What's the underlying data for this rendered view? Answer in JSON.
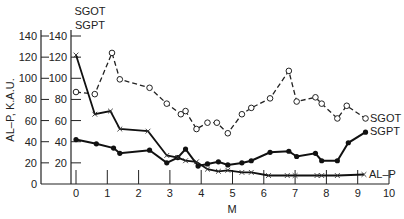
{
  "chart_data": {
    "type": "line",
    "title": "",
    "xlabel": "M",
    "ylabel_left": "AL–P, K.A.U.",
    "ylabel_right_lines": [
      "SGOT",
      "SGPT"
    ],
    "xlim": [
      0,
      10
    ],
    "ylim": [
      0,
      140
    ],
    "x_ticks": [
      0,
      1,
      2,
      3,
      4,
      5,
      6,
      7,
      8,
      9,
      10
    ],
    "x_tick_labels": [
      "0",
      "1",
      "2",
      "3",
      "4",
      "5",
      "6",
      "7",
      "8",
      "9",
      "10"
    ],
    "y_ticks": [
      0,
      20,
      40,
      60,
      80,
      100,
      120,
      140
    ],
    "y_tick_labels_left": [
      "0",
      "20",
      "40",
      "60",
      "80",
      "100",
      "120",
      "140"
    ],
    "y_tick_labels_inner": [
      "20",
      "40",
      "60",
      "80",
      "100",
      "120",
      "140"
    ],
    "grid": false,
    "legend": "inline labels at right end of each series",
    "series": [
      {
        "name": "SGOT",
        "marker": "open-circle",
        "line": "dashed",
        "x": [
          0,
          0.6,
          1.15,
          1.4,
          2.35,
          2.9,
          3.35,
          3.5,
          3.85,
          4.2,
          4.5,
          4.85,
          5.3,
          5.6,
          6.2,
          6.8,
          7.05,
          7.65,
          7.85,
          8.35,
          8.65,
          9.25
        ],
        "y": [
          87,
          85,
          124,
          99,
          91,
          76,
          66,
          69,
          52,
          58,
          58,
          48,
          66,
          72,
          81,
          107,
          78,
          82,
          76,
          62,
          74,
          62
        ]
      },
      {
        "name": "SGPT",
        "marker": "filled-circle",
        "line": "solid",
        "x": [
          0,
          0.65,
          1.2,
          1.4,
          2.35,
          2.9,
          3.25,
          3.5,
          3.9,
          4.2,
          4.55,
          4.85,
          5.3,
          5.6,
          6.2,
          6.8,
          7.05,
          7.65,
          7.85,
          8.35,
          8.7,
          9.25
        ],
        "y": [
          42,
          38,
          34,
          29,
          32,
          20,
          25,
          33,
          17,
          19,
          21,
          18,
          20,
          22,
          30,
          31,
          26,
          29,
          22,
          22,
          39,
          49
        ]
      },
      {
        "name": "AL–P",
        "marker": "x",
        "line": "solid",
        "x": [
          0,
          0.6,
          1.1,
          1.4,
          2.3,
          2.9,
          3.25,
          3.5,
          3.85,
          4.2,
          4.55,
          4.85,
          5.3,
          5.6,
          6.15,
          6.75,
          7.0,
          7.7,
          7.85,
          8.35,
          9.2
        ],
        "y": [
          122,
          66,
          69,
          52,
          50,
          27,
          25,
          22,
          21,
          14,
          12,
          13,
          11,
          11,
          8,
          8,
          8,
          8,
          8,
          8,
          9
        ]
      }
    ]
  }
}
